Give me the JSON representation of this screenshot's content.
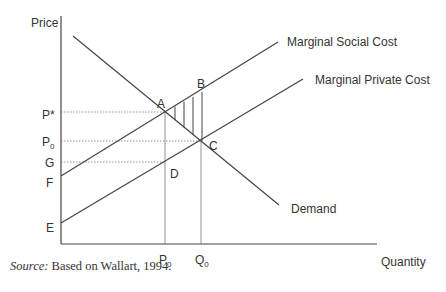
{
  "diagram": {
    "type": "supply-demand-externality",
    "axes": {
      "y_label": "Price",
      "x_label": "Quantity"
    },
    "y_ticks": [
      {
        "label": "P*",
        "sub": ""
      },
      {
        "label": "P",
        "sub": "0"
      },
      {
        "label": "G",
        "sub": ""
      },
      {
        "label": "F",
        "sub": ""
      },
      {
        "label": "E",
        "sub": ""
      }
    ],
    "x_ticks": [
      {
        "label": "P",
        "sub": "0"
      },
      {
        "label": "Q",
        "sub": "0"
      }
    ],
    "curves": {
      "msc": "Marginal Social Cost",
      "mpc": "Marginal Private Cost",
      "demand": "Demand"
    },
    "points": {
      "a": "A",
      "b": "B",
      "c": "C",
      "d": "D"
    },
    "shaded_region": "Triangle ABC (deadweight loss), vertically hatched"
  },
  "source": {
    "prefix": "Source:",
    "text": " Based on Wallart, 1994."
  },
  "colors": {
    "line": "#444444",
    "dotted": "#777777",
    "text": "#333333",
    "background": "#ffffff"
  }
}
